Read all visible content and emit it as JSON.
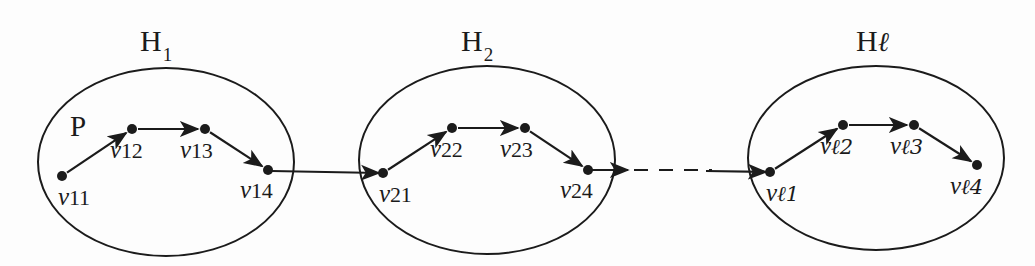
{
  "figure": {
    "background_color": "#fdfdfd",
    "ink_color": "#1b1b1b",
    "width": 1035,
    "height": 266
  },
  "path_marker": {
    "label": "P",
    "x": 70,
    "y": 112
  },
  "clusters": [
    {
      "id": "H1",
      "title_prefix": "H",
      "title_sub": "1",
      "title_is_script": false,
      "title_x": 140,
      "title_y": 26,
      "ellipse": {
        "cx": 166,
        "cy": 162,
        "rx": 128,
        "ry": 94
      },
      "vertices": [
        {
          "id": "v11",
          "label_v": "v",
          "label_idx": "11",
          "idx_is_script": false,
          "cx": 62,
          "cy": 176,
          "label_x": 58,
          "label_y": 184
        },
        {
          "id": "v12",
          "label_v": "v",
          "label_idx": "12",
          "idx_is_script": false,
          "cx": 132,
          "cy": 129,
          "label_x": 110,
          "label_y": 137
        },
        {
          "id": "v13",
          "label_v": "v",
          "label_idx": "13",
          "idx_is_script": false,
          "cx": 205,
          "cy": 129,
          "label_x": 180,
          "label_y": 137
        },
        {
          "id": "v14",
          "label_v": "v",
          "label_idx": "14",
          "idx_is_script": false,
          "cx": 268,
          "cy": 170,
          "label_x": 240,
          "label_y": 177
        }
      ],
      "edges": [
        {
          "from": "v11",
          "to": "v12"
        },
        {
          "from": "v12",
          "to": "v13"
        },
        {
          "from": "v13",
          "to": "v14"
        }
      ]
    },
    {
      "id": "H2",
      "title_prefix": "H",
      "title_sub": "2",
      "title_is_script": false,
      "title_x": 461,
      "title_y": 26,
      "ellipse": {
        "cx": 487,
        "cy": 160,
        "rx": 128,
        "ry": 94
      },
      "vertices": [
        {
          "id": "v21",
          "label_v": "v",
          "label_idx": "21",
          "idx_is_script": false,
          "cx": 383,
          "cy": 173,
          "label_x": 379,
          "label_y": 181
        },
        {
          "id": "v22",
          "label_v": "v",
          "label_idx": "22",
          "idx_is_script": false,
          "cx": 452,
          "cy": 128,
          "label_x": 430,
          "label_y": 136
        },
        {
          "id": "v23",
          "label_v": "v",
          "label_idx": "23",
          "idx_is_script": false,
          "cx": 525,
          "cy": 128,
          "label_x": 500,
          "label_y": 136
        },
        {
          "id": "v24",
          "label_v": "v",
          "label_idx": "24",
          "idx_is_script": false,
          "cx": 588,
          "cy": 170,
          "label_x": 560,
          "label_y": 177
        }
      ],
      "edges": [
        {
          "from": "v21",
          "to": "v22"
        },
        {
          "from": "v22",
          "to": "v23"
        },
        {
          "from": "v23",
          "to": "v24"
        }
      ]
    },
    {
      "id": "Hl",
      "title_prefix": "H",
      "title_sub": "ℓ",
      "title_is_script": true,
      "title_x": 856,
      "title_y": 26,
      "ellipse": {
        "cx": 876,
        "cy": 158,
        "rx": 128,
        "ry": 92
      },
      "vertices": [
        {
          "id": "vl1",
          "label_v": "v",
          "label_idx": "ℓ1",
          "idx_is_script": true,
          "cx": 770,
          "cy": 172,
          "label_x": 766,
          "label_y": 180
        },
        {
          "id": "vl2",
          "label_v": "v",
          "label_idx": "ℓ2",
          "idx_is_script": true,
          "cx": 843,
          "cy": 125,
          "label_x": 820,
          "label_y": 133
        },
        {
          "id": "vl3",
          "label_v": "v",
          "label_idx": "ℓ3",
          "idx_is_script": true,
          "cx": 914,
          "cy": 125,
          "label_x": 890,
          "label_y": 133
        },
        {
          "id": "vl4",
          "label_v": "v",
          "label_idx": "ℓ4",
          "idx_is_script": true,
          "cx": 977,
          "cy": 165,
          "label_x": 950,
          "label_y": 173
        }
      ],
      "edges": [
        {
          "from": "vl1",
          "to": "vl2"
        },
        {
          "from": "vl2",
          "to": "vl3"
        },
        {
          "from": "vl3",
          "to": "vl4"
        }
      ]
    }
  ],
  "connectors": [
    {
      "id": "connector-h1-h2",
      "style": "solid",
      "x1": 272,
      "y1": 171,
      "x2": 379,
      "y2": 173
    },
    {
      "id": "connector-h2-stub",
      "style": "solid",
      "x1": 592,
      "y1": 170,
      "x2": 628,
      "y2": 170
    },
    {
      "id": "connector-ellipsis",
      "style": "dashed",
      "x1": 634,
      "y1": 170,
      "x2": 712,
      "y2": 170
    },
    {
      "id": "connector-dash-to-hl",
      "style": "solid",
      "x1": 706,
      "y1": 171,
      "x2": 766,
      "y2": 172
    }
  ],
  "geometry": {
    "vertex_radius": 5,
    "stroke_width": 2.2,
    "ellipse_stroke_width": 2.0,
    "dash_pattern": "14 11"
  }
}
